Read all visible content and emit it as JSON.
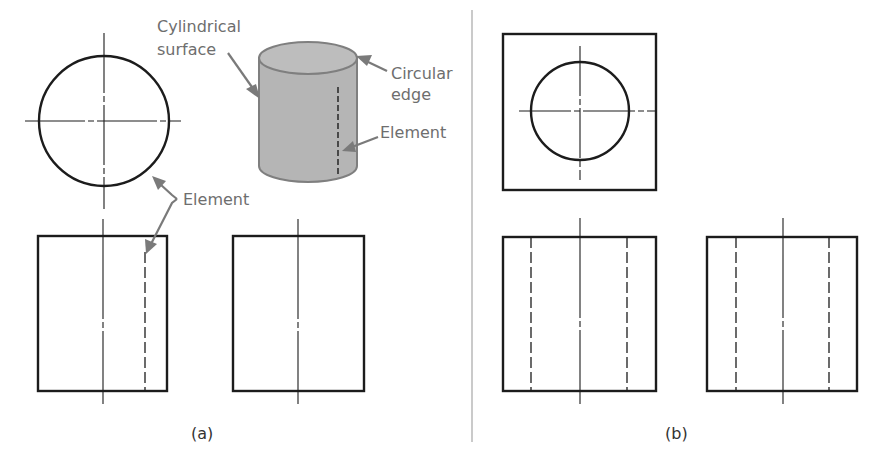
{
  "figure": {
    "panels": [
      {
        "id": "a",
        "caption": "(a)",
        "views": [
          "top-view-circle",
          "front-view-rect",
          "side-view-rect",
          "pictorial-cylinder"
        ]
      },
      {
        "id": "b",
        "caption": "(b)",
        "views": [
          "top-view-square-with-hole",
          "front-view-rect-hidden-lines",
          "side-view-rect-hidden-lines"
        ]
      }
    ],
    "callouts": {
      "cylindrical_surface_line1": "Cylindrical",
      "cylindrical_surface_line2": "surface",
      "circular_edge_line1": "Circular",
      "circular_edge_line2": "edge",
      "element_pictorial": "Element",
      "element_views": "Element"
    },
    "colors": {
      "line": "#1c1c1c",
      "callout_text": "#6e6e6e",
      "leader": "#7a7a7a",
      "cylinder_fill": "#b5b5b5",
      "cylinder_top_fill": "#bdbdbd",
      "divider": "#bdbdbd"
    }
  }
}
